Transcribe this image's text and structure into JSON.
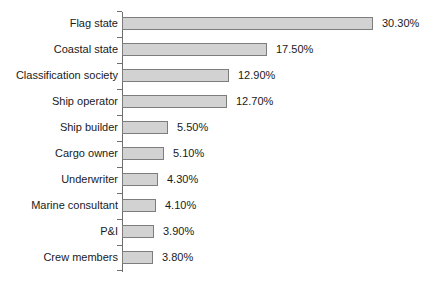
{
  "chart_data": {
    "type": "bar",
    "orientation": "horizontal",
    "title": "",
    "subtitle": "",
    "xlabel": "",
    "ylabel": "",
    "xlim": [
      0,
      30.3
    ],
    "grid": false,
    "legend": null,
    "value_suffix": "%",
    "categories": [
      "Flag state",
      "Coastal state",
      "Classification society",
      "Ship operator",
      "Ship builder",
      "Cargo owner",
      "Underwriter",
      "Marine consultant",
      "P&I",
      "Crew members"
    ],
    "values": [
      30.3,
      17.5,
      12.9,
      12.7,
      5.5,
      5.1,
      4.3,
      4.1,
      3.9,
      3.8
    ],
    "value_labels": [
      "30.30%",
      "17.50%",
      "12.90%",
      "12.70%",
      "5.50%",
      "5.10%",
      "4.30%",
      "4.10%",
      "3.90%",
      "3.80%"
    ],
    "bars": [
      {
        "category": "Flag state",
        "value": 30.3,
        "value_label": "30.30%"
      },
      {
        "category": "Coastal state",
        "value": 17.5,
        "value_label": "17.50%"
      },
      {
        "category": "Classification society",
        "value": 12.9,
        "value_label": "12.90%"
      },
      {
        "category": "Ship operator",
        "value": 12.7,
        "value_label": "12.70%"
      },
      {
        "category": "Ship builder",
        "value": 5.5,
        "value_label": "5.50%"
      },
      {
        "category": "Cargo owner",
        "value": 5.1,
        "value_label": "5.10%"
      },
      {
        "category": "Underwriter",
        "value": 4.3,
        "value_label": "4.30%"
      },
      {
        "category": "Marine consultant",
        "value": 4.1,
        "value_label": "4.10%"
      },
      {
        "category": "P&I",
        "value": 3.9,
        "value_label": "3.90%"
      },
      {
        "category": "Crew members",
        "value": 3.8,
        "value_label": "3.80%"
      }
    ],
    "colors": {
      "bar_fill": "#d2d2d2",
      "bar_border": "#7d7d7d",
      "axis": "#6e6e6e",
      "text": "#1a1a1a",
      "background": "#ffffff"
    },
    "layout": {
      "axis_x": 122,
      "axis_top": 12,
      "axis_height": 260,
      "row_pitch": 26,
      "first_bar_top": 17,
      "bar_height": 13,
      "px_per_unit": 8.28,
      "value_label_gap": 9
    }
  }
}
